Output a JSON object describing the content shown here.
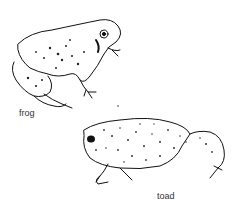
{
  "figures": [
    {
      "name": "frog",
      "label": "frog"
    },
    {
      "name": "toad",
      "label": "toad"
    }
  ]
}
